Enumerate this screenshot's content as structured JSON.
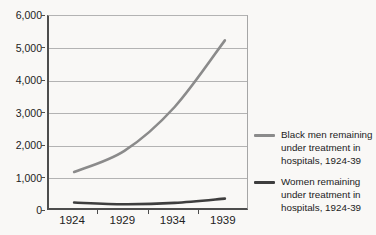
{
  "chart_data": {
    "type": "line",
    "title": "",
    "xlabel": "",
    "ylabel": "",
    "categories": [
      "1924",
      "1929",
      "1934",
      "1939"
    ],
    "series": [
      {
        "name": "Black men remaining under treatment in hospitals, 1924-39",
        "values": [
          1200,
          1850,
          3200,
          5250
        ],
        "color": "#8b8b8b"
      },
      {
        "name": "Women remaining under treatment in hospitals, 1924-39",
        "values": [
          260,
          210,
          250,
          380
        ],
        "color": "#3e3e3e"
      }
    ],
    "ylim": [
      0,
      6000
    ],
    "ytick_step": 1000,
    "ytick_labels": [
      "0",
      "1,000",
      "2,000",
      "3,000",
      "4,000",
      "5,000",
      "6,000"
    ],
    "grid": true,
    "legend_position": "right"
  },
  "legend": {
    "items": [
      {
        "label": "Black men remaining under treatment in hospitals, 1924-39",
        "color": "#8b8b8b"
      },
      {
        "label": "Women remaining under treatment in hospitals, 1924-39",
        "color": "#3e3e3e"
      }
    ]
  },
  "colors": {
    "background": "#f9f8f6",
    "gridline": "#b3b3b3",
    "axis": "#4d4d4d",
    "plot_right_border": "#a6a6a6",
    "text": "#222222",
    "series_black_men": "#8b8b8b",
    "series_women": "#3e3e3e"
  }
}
